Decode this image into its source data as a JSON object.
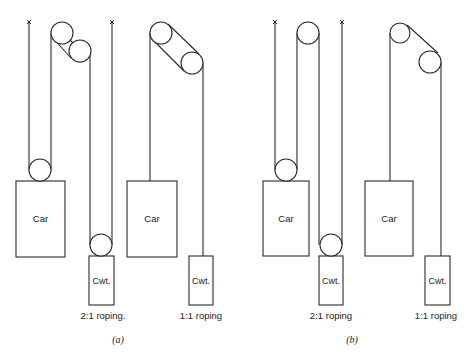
{
  "figure": {
    "colors": {
      "line": "#2a2a2a",
      "background": "#ffffff"
    },
    "panels": [
      {
        "caption": "(a)",
        "caption_pos": [
          118,
          334
        ],
        "systems": [
          {
            "id": "a-2to1",
            "ratio_label": "2:1 roping.",
            "label_pos": [
              103,
              310
            ],
            "anchors": [
              [
                29,
                22
              ]
            ],
            "sheaves": [
              [
                62,
                33,
                11
              ],
              [
                80,
                51,
                11
              ],
              [
                40,
                170,
                11
              ],
              [
                101,
                245,
                11
              ]
            ],
            "ropes": [
              [
                [
                  29,
                  22
                ],
                [
                  29,
                  170
                ]
              ],
              [
                [
                  51,
                  170
                ],
                [
                  51,
                  33
                ]
              ],
              [
                [
                  112,
                  22
                ],
                [
                  112,
                  245
                ]
              ],
              [
                [
                  90,
                  245
                ],
                [
                  90,
                  51
                ]
              ]
            ],
            "tangents": [
              [
                [
                  55,
                  25
                ],
                [
                  73,
                  43
                ]
              ],
              [
                [
                  51,
                  36
                ],
                [
                  71,
                  58
                ]
              ]
            ],
            "car": {
              "label": "Car",
              "rect": [
                16,
                181,
                49,
                76
              ]
            },
            "cwt": {
              "label": "Cwt.",
              "rect": [
                89,
                256,
                25,
                49
              ]
            }
          },
          {
            "id": "a-1to1",
            "ratio_label": "1:1 roping",
            "label_pos": [
              201,
              310
            ],
            "anchors": [
              [
                112,
                22
              ]
            ],
            "sheaves": [
              [
                161,
                33,
                11
              ],
              [
                192,
                63,
                11
              ]
            ],
            "ropes": [
              [
                [
                  150,
                  33
                ],
                [
                  150,
                  181
                ]
              ],
              [
                [
                  203,
                  63
                ],
                [
                  203,
                  256
                ]
              ]
            ],
            "tangents": [
              [
                [
                  168,
                  24
                ],
                [
                  199,
                  54
                ]
              ],
              [
                [
                  151,
                  38
                ],
                [
                  184,
                  71
                ]
              ]
            ],
            "car": {
              "label": "Car",
              "rect": [
                127,
                181,
                50,
                76
              ]
            },
            "cwt": {
              "label": "Cwt.",
              "rect": [
                189,
                256,
                24,
                49
              ]
            }
          }
        ]
      },
      {
        "caption": "(b)",
        "caption_pos": [
          352,
          334
        ],
        "systems": [
          {
            "id": "b-2to1",
            "ratio_label": "2:1 roping",
            "label_pos": [
              331,
              310
            ],
            "anchors": [
              [
                275,
                22
              ]
            ],
            "sheaves": [
              [
                308,
                33,
                11
              ],
              [
                286,
                170,
                11
              ],
              [
                331,
                245,
                11
              ]
            ],
            "ropes": [
              [
                [
                  275,
                  22
                ],
                [
                  275,
                  170
                ]
              ],
              [
                [
                  297,
                  170
                ],
                [
                  297,
                  33
                ]
              ],
              [
                [
                  319,
                  33
                ],
                [
                  319,
                  245
                ]
              ],
              [
                [
                  342,
                  22
                ],
                [
                  342,
                  245
                ]
              ]
            ],
            "tangents": [],
            "car": {
              "label": "Car",
              "rect": [
                263,
                181,
                46,
                75
              ]
            },
            "cwt": {
              "label": "Cwt.",
              "rect": [
                319,
                256,
                24,
                49
              ]
            }
          },
          {
            "id": "b-1to1",
            "ratio_label": "1:1 roping",
            "label_pos": [
              436,
              310
            ],
            "anchors": [
              [
                342,
                22
              ]
            ],
            "sheaves": [
              [
                400,
                33,
                10
              ],
              [
                430,
                62,
                11
              ]
            ],
            "ropes": [
              [
                [
                  390,
                  33
                ],
                [
                  390,
                  181
                ]
              ],
              [
                [
                  441,
                  62
                ],
                [
                  441,
                  256
                ]
              ]
            ],
            "tangents": [
              [
                [
                  407,
                  25
                ],
                [
                  438,
                  53
                ]
              ]
            ],
            "car": {
              "label": "Car",
              "rect": [
                365,
                181,
                48,
                75
              ]
            },
            "cwt": {
              "label": "Cwt.",
              "rect": [
                425,
                256,
                25,
                49
              ]
            }
          }
        ]
      }
    ]
  },
  "labels": {
    "a_2to1": "2:1 roping.",
    "a_1to1": "1:1 roping",
    "b_2to1": "2:1 roping",
    "b_1to1": "1:1 roping",
    "car": "Car",
    "cwt": "Cwt.",
    "caption_a": "(a)",
    "caption_b": "(b)"
  }
}
